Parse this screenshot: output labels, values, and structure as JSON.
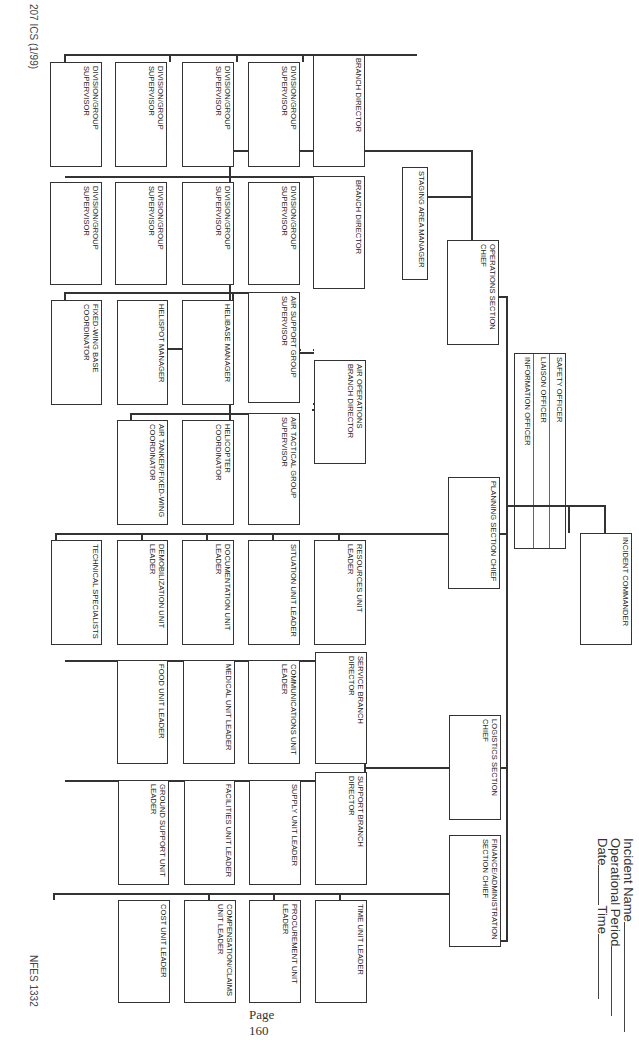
{
  "document": {
    "orientation": "landscape-rotated-90-clockwise",
    "form_id": "207 ICS (1/99)",
    "form_number": "NFES 1332",
    "page_label": "Page 160"
  },
  "header": {
    "incident_name_label": "Incident Name",
    "operational_period_label": "Operational Period",
    "date_label": "Date",
    "time_label": "Time"
  },
  "command": {
    "incident_commander": "INCIDENT COMMANDER",
    "staff": [
      "SAFETY OFFICER",
      "LIAISON OFFICER",
      "INFORMATION OFFICER"
    ]
  },
  "operations": {
    "chief": "OPERATIONS SECTION CHIEF",
    "staging": "STAGING AREA MANAGER",
    "branches": [
      {
        "director": "BRANCH DIRECTOR",
        "divisions": [
          "DIVISION/GROUP SUPERVISOR",
          "DIVISION/GROUP SUPERVISOR",
          "DIVISION/GROUP SUPERVISOR",
          "DIVISION/GROUP SUPERVISOR"
        ]
      },
      {
        "director": "BRANCH DIRECTOR",
        "divisions": [
          "DIVISION/GROUP SUPERVISOR",
          "DIVISION/GROUP SUPERVISOR",
          "DIVISION/GROUP SUPERVISOR",
          "DIVISION/GROUP SUPERVISOR"
        ]
      }
    ],
    "air_ops": {
      "director": "AIR OPERATIONS BRANCH DIRECTOR",
      "support_group": {
        "supervisor": "AIR SUPPORT GROUP SUPERVISOR",
        "units": [
          "HELIBASE MANAGER",
          "HELISPOT MANAGER",
          "FIXED-WING BASE COORDINATOR"
        ]
      },
      "tactical_group": {
        "supervisor": "AIR TACTICAL GROUP SUPERVISOR",
        "units": [
          "HELICOPTER COORDINATOR",
          "AIR TANKER/FIXED-WING COORDINATOR"
        ]
      }
    }
  },
  "planning": {
    "chief": "PLANNING SECTION CHIEF",
    "units": [
      "RESOURCES UNIT LEADER",
      "SITUATION UNIT LEADER",
      "DOCUMENTATION UNIT LEADER",
      "DEMOBILIZATION UNIT LEADER",
      "TECHNICAL SPECIALISTS"
    ]
  },
  "logistics": {
    "chief": "LOGISTICS SECTION CHIEF",
    "service_branch": {
      "director": "SERVICE BRANCH DIRECTOR",
      "units": [
        "COMMUNICATIONS UNIT LEADER",
        "MEDICAL UNIT LEADER",
        "FOOD UNIT LEADER"
      ]
    },
    "support_branch": {
      "director": "SUPPORT BRANCH DIRECTOR",
      "units": [
        "SUPPLY UNIT LEADER",
        "FACILITIES UNIT LEADER",
        "GROUND SUPPORT UNIT LEADER"
      ]
    }
  },
  "finance": {
    "chief": "FINANCE/ADMINISTRATION SECTION CHIEF",
    "units": [
      "TIME UNIT LEADER",
      "PROCUREMENT UNIT LEADER",
      "COMPENSATION/CLAIMS UNIT LEADER",
      "COST UNIT LEADER"
    ]
  }
}
